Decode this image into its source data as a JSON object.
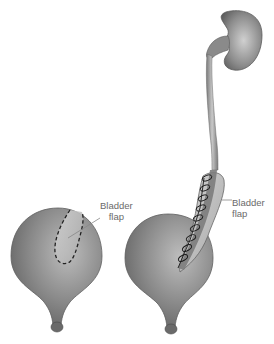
{
  "diagram": {
    "labels": [
      {
        "line1": "Bladder",
        "line2": "flap"
      },
      {
        "line1": "Bladder",
        "line2": "flap"
      }
    ],
    "components": [
      {
        "name": "left-bladder",
        "note": "bladder with dashed outline marking flap to be cut"
      },
      {
        "name": "right-bladder",
        "note": "bladder with tubularized flap sutured to ureter"
      },
      {
        "name": "kidney"
      },
      {
        "name": "ureter"
      }
    ],
    "colors": {
      "organ_dark": "#6e6e6e",
      "organ_light": "#b5b5b5",
      "flap_light": "#c8c8c8",
      "outline": "#555555",
      "suture": "#1a1a1a",
      "label_text": "#6a6a6a",
      "leader_line": "#888888"
    }
  }
}
